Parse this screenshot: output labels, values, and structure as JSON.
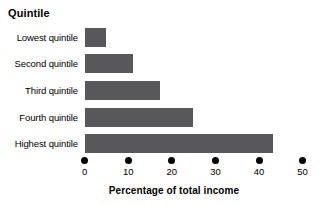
{
  "chart_data": {
    "type": "bar",
    "orientation": "horizontal",
    "title": "Quintile",
    "xlabel": "Percentage of total income",
    "ylabel": "Quintile",
    "categories": [
      "Lowest quintile",
      "Second quintile",
      "Third quintile",
      "Fourth quintile",
      "Highest quintile"
    ],
    "values": [
      4.9,
      11.2,
      17.3,
      24.8,
      43.3
    ],
    "xlim": [
      0,
      50
    ],
    "xticks": [
      0,
      10,
      20,
      30,
      40,
      50
    ],
    "xtick_labels": [
      "0",
      "10",
      "20",
      "30",
      "40",
      "50"
    ],
    "grid": false,
    "legend": false,
    "bar_color": "#58585a",
    "background_color": "#ffffff",
    "text_color": "#000000"
  },
  "labels": {
    "title": "Quintile",
    "axis_title": "Percentage of total income",
    "cat0": "Lowest quintile",
    "cat1": "Second quintile",
    "cat2": "Third quintile",
    "cat3": "Fourth quintile",
    "cat4": "Highest quintile",
    "tick0": "0",
    "tick1": "10",
    "tick2": "20",
    "tick3": "30",
    "tick4": "40",
    "tick5": "50"
  }
}
